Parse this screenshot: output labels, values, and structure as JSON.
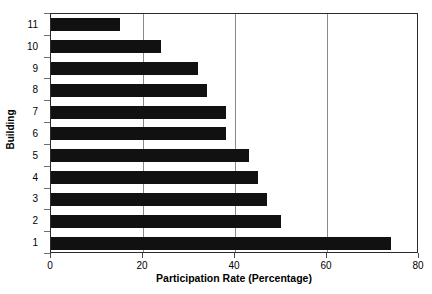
{
  "chart_data": {
    "type": "bar",
    "orientation": "horizontal",
    "title": "",
    "xlabel": "Participation Rate (Percentage)",
    "ylabel": "Building",
    "categories": [
      "11",
      "10",
      "9",
      "8",
      "7",
      "6",
      "5",
      "4",
      "3",
      "2",
      "1"
    ],
    "values": [
      15,
      24,
      32,
      34,
      38,
      38,
      43,
      45,
      47,
      50,
      74
    ],
    "xlim": [
      0,
      80
    ],
    "xticks": [
      0,
      20,
      40,
      60,
      80
    ],
    "xtick_labels": [
      "0",
      "20",
      "40",
      "60",
      "80"
    ],
    "ytick_labels": [
      "11",
      "10",
      "9",
      "8",
      "7",
      "6",
      "5",
      "4",
      "3",
      "2",
      "1"
    ],
    "grid": "vertical-only",
    "gridline_values": [
      20,
      40,
      60
    ],
    "legend": null,
    "bar_color": "#111111",
    "background_color": "#ffffff",
    "axis_color": "#2b2b2b",
    "gridline_color": "#8a8a8a",
    "series": [
      {
        "name": "Participation Rate",
        "points": [
          {
            "category": "11",
            "value": 15
          },
          {
            "category": "10",
            "value": 24
          },
          {
            "category": "9",
            "value": 32
          },
          {
            "category": "8",
            "value": 34
          },
          {
            "category": "7",
            "value": 38
          },
          {
            "category": "6",
            "value": 38
          },
          {
            "category": "5",
            "value": 43
          },
          {
            "category": "4",
            "value": 45
          },
          {
            "category": "3",
            "value": 47
          },
          {
            "category": "2",
            "value": 50
          },
          {
            "category": "1",
            "value": 74
          }
        ]
      }
    ]
  }
}
